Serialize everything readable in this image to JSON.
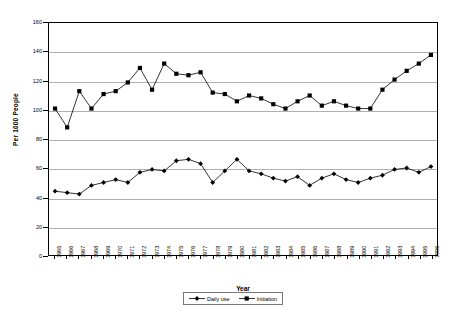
{
  "chart_data": {
    "type": "line",
    "title": "",
    "xlabel": "Year",
    "ylabel": "Per 1000 People",
    "ylim": [
      0,
      160
    ],
    "ytick_step": 20,
    "yticks": [
      0,
      20,
      40,
      60,
      80,
      100,
      120,
      140,
      160
    ],
    "grid": "horizontal",
    "legend_position": "bottom-center",
    "marker_color": "#000000",
    "line_color": "#000000",
    "gridline_color": "#b0b0b0",
    "categories": [
      "1965",
      "1966",
      "1967",
      "1968",
      "1969",
      "1970",
      "1971",
      "1972",
      "1973",
      "1974",
      "1975",
      "1976",
      "1977",
      "1978",
      "1979",
      "1980",
      "1981",
      "1982",
      "1983",
      "1984",
      "1985",
      "1986",
      "1987",
      "1988",
      "1989",
      "1990",
      "1991",
      "1992",
      "1993",
      "1994",
      "1995",
      "1996"
    ],
    "series": [
      {
        "name": "Daily use",
        "marker": "diamond",
        "values": [
          44,
          43,
          42,
          48,
          50,
          52,
          50,
          57,
          59,
          58,
          65,
          66,
          63,
          50,
          58,
          66,
          58,
          56,
          53,
          51,
          54,
          48,
          53,
          56,
          52,
          50,
          53,
          55,
          59,
          60,
          57,
          61
        ]
      },
      {
        "name": "Initiation",
        "marker": "square",
        "values": [
          101,
          88,
          113,
          101,
          111,
          113,
          119,
          129,
          114,
          132,
          125,
          124,
          126,
          112,
          111,
          106,
          110,
          108,
          104,
          101,
          106,
          110,
          103,
          106,
          103,
          101,
          101,
          114,
          121,
          127,
          132,
          138
        ]
      }
    ],
    "daily_use_tail": [
      60,
      65,
      70,
      75
    ],
    "notes": ""
  },
  "legend": {
    "items": [
      {
        "label": "Daily use",
        "marker": "diamond"
      },
      {
        "label": "Initiation",
        "marker": "square"
      }
    ]
  },
  "axes": {
    "y_title": "Per 1000 People",
    "x_title": "Year"
  }
}
